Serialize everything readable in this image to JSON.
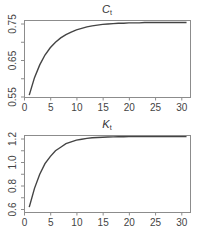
{
  "chart_data": [
    {
      "type": "line",
      "title": "C_t",
      "title_main": "C",
      "title_sub": "t",
      "xlabel": "",
      "ylabel": "",
      "xlim": [
        0,
        31
      ],
      "ylim": [
        0.55,
        0.755
      ],
      "x_ticks": [
        0,
        5,
        10,
        15,
        20,
        25,
        30
      ],
      "x_tick_labels": [
        "0",
        "5",
        "10",
        "15",
        "20",
        "25",
        "30"
      ],
      "y_ticks": [
        0.55,
        0.6,
        0.65,
        0.7,
        0.75
      ],
      "y_tick_labels": [
        "0.55",
        "",
        "0.65",
        "",
        "0.75"
      ],
      "grid": false,
      "series": [
        {
          "name": "C_t",
          "x": [
            1,
            2,
            3,
            4,
            5,
            6,
            7,
            8,
            9,
            10,
            11,
            12,
            13,
            14,
            15,
            16,
            17,
            18,
            19,
            20,
            21,
            22,
            23,
            24,
            25,
            26,
            27,
            28,
            29,
            30,
            31
          ],
          "values": [
            0.555,
            0.603,
            0.638,
            0.665,
            0.685,
            0.7,
            0.712,
            0.721,
            0.728,
            0.734,
            0.738,
            0.742,
            0.745,
            0.747,
            0.749,
            0.75,
            0.751,
            0.752,
            0.752,
            0.753,
            0.753,
            0.753,
            0.754,
            0.754,
            0.754,
            0.754,
            0.754,
            0.754,
            0.754,
            0.754,
            0.754
          ]
        }
      ]
    },
    {
      "type": "line",
      "title": "K_t",
      "title_main": "K",
      "title_sub": "t",
      "xlabel": "",
      "ylabel": "",
      "xlim": [
        0,
        31
      ],
      "ylim": [
        0.6,
        1.22
      ],
      "x_ticks": [
        0,
        5,
        10,
        15,
        20,
        25,
        30
      ],
      "x_tick_labels": [
        "0",
        "5",
        "10",
        "15",
        "20",
        "25",
        "30"
      ],
      "y_ticks": [
        0.6,
        0.7,
        0.8,
        0.9,
        1.0,
        1.1,
        1.2
      ],
      "y_tick_labels": [
        "0.6",
        "",
        "0.8",
        "",
        "1.0",
        "",
        "1.2"
      ],
      "grid": false,
      "series": [
        {
          "name": "K_t",
          "x": [
            1,
            2,
            3,
            4,
            5,
            6,
            7,
            8,
            9,
            10,
            11,
            12,
            13,
            14,
            15,
            16,
            17,
            18,
            19,
            20,
            21,
            22,
            23,
            24,
            25,
            26,
            27,
            28,
            29,
            30,
            31
          ],
          "values": [
            0.62,
            0.78,
            0.9,
            0.99,
            1.05,
            1.1,
            1.13,
            1.16,
            1.175,
            1.19,
            1.198,
            1.205,
            1.21,
            1.213,
            1.215,
            1.217,
            1.218,
            1.219,
            1.219,
            1.22,
            1.22,
            1.22,
            1.22,
            1.22,
            1.22,
            1.22,
            1.22,
            1.22,
            1.22,
            1.22,
            1.22
          ]
        }
      ]
    }
  ]
}
